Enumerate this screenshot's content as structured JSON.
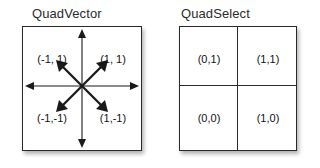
{
  "figure": {
    "background_color": "#ffffff",
    "line_color": "#2a2a2a",
    "text_color": "#111111"
  },
  "panels": [
    {
      "key": "quadvector",
      "title": "QuadVector",
      "box": {
        "x": 22,
        "y": 26,
        "width": 120,
        "height": 125
      },
      "origin": {
        "x": 82,
        "y": 86
      },
      "labels": [
        {
          "text": "(-1, 1)",
          "quadrant": "top-left",
          "x": 52,
          "y": 59
        },
        {
          "text": "(1, 1)",
          "quadrant": "top-right",
          "x": 112,
          "y": 59
        },
        {
          "text": "(-1,-1)",
          "quadrant": "bottom-left",
          "x": 52,
          "y": 118
        },
        {
          "text": "(1,-1)",
          "quadrant": "bottom-right",
          "x": 112,
          "y": 118
        }
      ],
      "vectors": [
        {
          "name": "up",
          "dx": 0,
          "dy": -1
        },
        {
          "name": "down",
          "dx": 0,
          "dy": 1
        },
        {
          "name": "left",
          "dx": -1,
          "dy": 0
        },
        {
          "name": "right",
          "dx": 1,
          "dy": 0
        },
        {
          "name": "up-left",
          "dx": -1,
          "dy": -1
        },
        {
          "name": "up-right",
          "dx": 1,
          "dy": -1
        },
        {
          "name": "down-left",
          "dx": -1,
          "dy": 1
        },
        {
          "name": "down-right",
          "dx": 1,
          "dy": 1
        }
      ]
    },
    {
      "key": "quadselect",
      "title": "QuadSelect",
      "box": {
        "x": 179,
        "y": 26,
        "width": 118,
        "height": 125
      },
      "labels": [
        {
          "text": "(0,1)",
          "quadrant": "top-left",
          "x": 209,
          "y": 59
        },
        {
          "text": "(1,1)",
          "quadrant": "top-right",
          "x": 268,
          "y": 59
        },
        {
          "text": "(0,0)",
          "quadrant": "bottom-left",
          "x": 209,
          "y": 118
        },
        {
          "text": "(1,0)",
          "quadrant": "bottom-right",
          "x": 268,
          "y": 118
        }
      ]
    }
  ]
}
